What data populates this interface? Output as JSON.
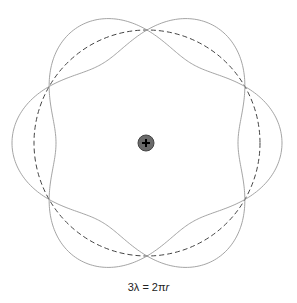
{
  "diagram": {
    "center": [
      147,
      143
    ],
    "orbit_radius": 113,
    "wave_amplitude": 22,
    "wavelengths": 3,
    "nodes": 6,
    "colors": {
      "wave": "#9a9a9a",
      "orbit": "#444444",
      "nucleus_fill": "#6a6a6a",
      "nucleus_stroke": "#444444",
      "nucleus_sign": "#000000"
    },
    "nucleus": {
      "radius": 8,
      "symbol": "+",
      "label": "nucleus"
    }
  },
  "caption": {
    "lhs": "3λ = 2π",
    "var": "r"
  }
}
